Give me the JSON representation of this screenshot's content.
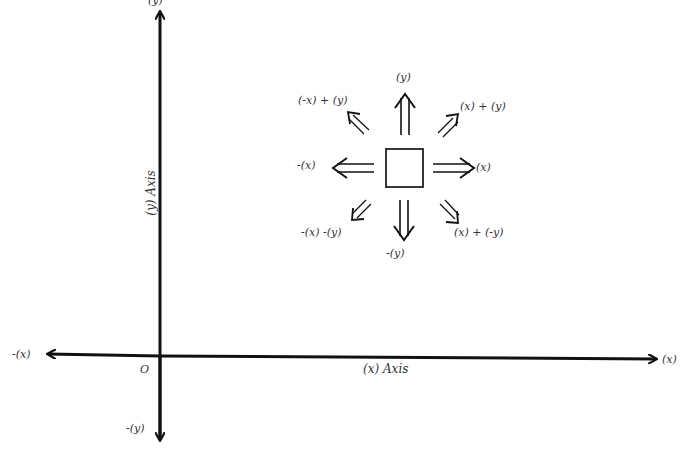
{
  "diagram": {
    "axes": {
      "x_axis_label": "(x) Axis",
      "y_axis_label": "(y) Axis",
      "origin_label": "O",
      "pos_x_label": "(x)",
      "neg_x_label": "-(x)",
      "pos_y_label": "(y)",
      "neg_y_label": "-(y)"
    },
    "compass": {
      "center_shape": "square",
      "directions": {
        "up": "(y)",
        "down": "-(y)",
        "left": "-(x)",
        "right": "(x)",
        "up_left": "(-x) + (y)",
        "up_right": "(x) + (y)",
        "down_left": "-(x) -(y)",
        "down_right": "(x) + (-y)"
      }
    }
  }
}
